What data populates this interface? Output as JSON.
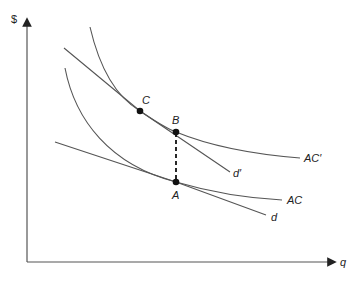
{
  "diagram": {
    "axes": {
      "y_label": "$",
      "x_label": "q"
    },
    "curves": [
      {
        "id": "ac-prime",
        "label": "AC′",
        "type": "average-cost curve"
      },
      {
        "id": "d-prime",
        "label": "d′",
        "type": "demand line"
      },
      {
        "id": "ac",
        "label": "AC",
        "type": "average-cost curve"
      },
      {
        "id": "d",
        "label": "d",
        "type": "demand line"
      }
    ],
    "points": [
      {
        "label": "C",
        "description": "tangency of d′ and AC′"
      },
      {
        "label": "B",
        "description": "point on AC′ above A"
      },
      {
        "label": "A",
        "description": "tangency of d and AC"
      }
    ],
    "connectors": [
      {
        "from": "B",
        "to": "A",
        "style": "dashed"
      }
    ],
    "colors": {
      "curve": "#555555",
      "point": "#111111",
      "text": "#222222",
      "background": "#ffffff"
    }
  }
}
